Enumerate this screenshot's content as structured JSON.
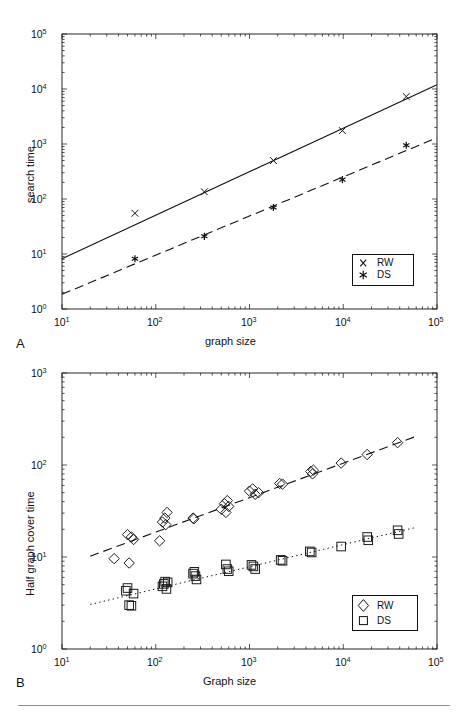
{
  "figure": {
    "background": "#ffffff",
    "ink_color": "#111111",
    "rule_color": "#8d8d8d"
  },
  "panels": [
    {
      "letter": "A",
      "xlabel": "graph size",
      "ylabel": "search time",
      "xticks": [
        "10¹",
        "10²",
        "10³",
        "10⁴",
        "10⁵"
      ],
      "yticks": [
        "10⁰",
        "10¹",
        "10²",
        "10³",
        "10⁴",
        "10⁵"
      ],
      "legend": [
        {
          "marker": "cross-marker",
          "label": "RW"
        },
        {
          "marker": "asterisk-marker",
          "label": "DS"
        }
      ]
    },
    {
      "letter": "B",
      "xlabel": "Graph size",
      "ylabel": "Half graph cover time",
      "xticks": [
        "10¹",
        "10²",
        "10³",
        "10⁴",
        "10⁵"
      ],
      "yticks": [
        "10⁰",
        "10¹",
        "10²",
        "10³"
      ],
      "legend": [
        {
          "marker": "diamond-marker",
          "label": "RW"
        },
        {
          "marker": "square-marker",
          "label": "DS"
        }
      ]
    }
  ],
  "chart_data": [
    {
      "id": "panel-a",
      "type": "scatter",
      "title": "",
      "xlabel": "graph size",
      "ylabel": "search time",
      "xscale": "log",
      "yscale": "log",
      "xlim": [
        10,
        100000
      ],
      "ylim": [
        1,
        100000
      ],
      "grid": false,
      "legend_position": "lower-right",
      "series": [
        {
          "name": "RW",
          "marker": "cross-marker",
          "line_style": "solid",
          "x": [
            60,
            330,
            1800,
            9800,
            47000
          ],
          "y": [
            55,
            135,
            500,
            1750,
            7300
          ],
          "fit_line": {
            "style": "solid",
            "x": [
              10,
              100000
            ],
            "y": [
              8.2,
              12000
            ]
          }
        },
        {
          "name": "DS",
          "marker": "asterisk-marker",
          "line_style": "dashed",
          "x": [
            60,
            330,
            1800,
            9800,
            47000
          ],
          "y": [
            8.2,
            21,
            70,
            225,
            950
          ],
          "fit_line": {
            "style": "dashed",
            "x": [
              10,
              100000
            ],
            "y": [
              1.85,
              1300
            ]
          }
        }
      ]
    },
    {
      "id": "panel-b",
      "type": "scatter",
      "title": "",
      "xlabel": "Graph size",
      "ylabel": "Half graph cover time",
      "xscale": "log",
      "yscale": "log",
      "xlim": [
        10,
        100000
      ],
      "ylim": [
        1,
        1000
      ],
      "grid": false,
      "legend_position": "lower-right",
      "series": [
        {
          "name": "RW",
          "marker": "diamond-marker",
          "line_style": "dashed",
          "x": [
            36,
            50,
            52,
            55,
            58,
            110,
            118,
            125,
            128,
            132,
            250,
            255,
            500,
            540,
            560,
            580,
            600,
            1000,
            1080,
            1150,
            1250,
            2100,
            2250,
            4500,
            4700,
            4800,
            9500,
            18000,
            38000
          ],
          "y": [
            9.6,
            17.5,
            8.6,
            16.5,
            15.5,
            15.0,
            24.0,
            26.5,
            22.5,
            30.5,
            26.5,
            26.0,
            33.0,
            38.0,
            30.5,
            41.0,
            35.5,
            52.0,
            55.0,
            48.0,
            50.0,
            63.0,
            62.0,
            85.0,
            80.0,
            88.0,
            105.0,
            130.0,
            175.0
          ],
          "fit_line": {
            "style": "dashed",
            "x": [
              20,
              60000
            ],
            "y": [
              10.2,
              205
            ]
          }
        },
        {
          "name": "DS",
          "marker": "square-marker",
          "line_style": "dotted",
          "x": [
            48,
            50,
            52,
            55,
            58,
            118,
            122,
            126,
            130,
            134,
            250,
            258,
            265,
            272,
            560,
            580,
            600,
            1050,
            1100,
            1150,
            2150,
            2250,
            4400,
            4600,
            9500,
            18000,
            18500,
            38000,
            39000
          ],
          "y": [
            4.3,
            4.6,
            3.0,
            2.95,
            4.0,
            4.8,
            5.1,
            5.4,
            4.5,
            5.3,
            6.6,
            6.9,
            6.2,
            5.7,
            8.3,
            7.4,
            7.0,
            8.2,
            7.9,
            7.4,
            9.3,
            9.1,
            11.5,
            11.2,
            13.0,
            16.5,
            15.2,
            19.5,
            17.8
          ],
          "fit_line": {
            "style": "dotted",
            "x": [
              20,
              60000
            ],
            "y": [
              3.05,
              21.0
            ]
          }
        }
      ]
    }
  ]
}
